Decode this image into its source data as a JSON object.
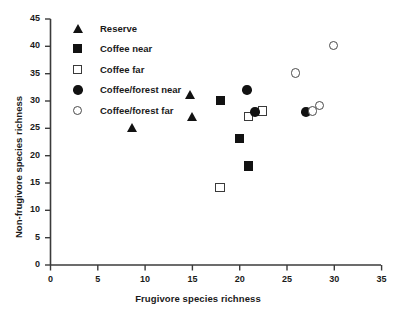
{
  "chart_data": {
    "type": "scatter",
    "title": "",
    "xlabel": "Frugivore species richness",
    "ylabel": "Non-frugivore species richness",
    "xlim": [
      0,
      35
    ],
    "ylim": [
      0,
      45
    ],
    "xticks": [
      0,
      5,
      10,
      15,
      20,
      25,
      30,
      35
    ],
    "yticks": [
      0,
      5,
      10,
      15,
      20,
      25,
      30,
      35,
      40,
      45
    ],
    "grid": false,
    "legend_position": "top-left-inside",
    "series": [
      {
        "name": "Reserve",
        "marker": "triangle-filled",
        "color": "#121212",
        "points": [
          {
            "x": 8.7,
            "y": 25
          },
          {
            "x": 14.8,
            "y": 31
          },
          {
            "x": 15.0,
            "y": 27
          }
        ]
      },
      {
        "name": "Coffee near",
        "marker": "square-filled",
        "color": "#121212",
        "points": [
          {
            "x": 18.0,
            "y": 30
          },
          {
            "x": 20.0,
            "y": 23
          },
          {
            "x": 21.0,
            "y": 18
          }
        ]
      },
      {
        "name": "Coffee far",
        "marker": "square-open",
        "color": "#3a3a3a",
        "points": [
          {
            "x": 18.0,
            "y": 14
          },
          {
            "x": 21.0,
            "y": 27
          },
          {
            "x": 22.5,
            "y": 28
          }
        ]
      },
      {
        "name": "Coffee/forest near",
        "marker": "circle-filled",
        "color": "#121212",
        "points": [
          {
            "x": 20.8,
            "y": 32
          },
          {
            "x": 21.6,
            "y": 28
          },
          {
            "x": 27.0,
            "y": 28
          }
        ]
      },
      {
        "name": "Coffee/forest far",
        "marker": "circle-open",
        "color": "#4a4a4a",
        "points": [
          {
            "x": 26.0,
            "y": 35
          },
          {
            "x": 27.8,
            "y": 28
          },
          {
            "x": 28.5,
            "y": 29
          },
          {
            "x": 30.0,
            "y": 40
          }
        ]
      }
    ]
  },
  "legend": {
    "items": [
      {
        "label": "Reserve",
        "marker": "triangle-filled"
      },
      {
        "label": "Coffee near",
        "marker": "square-filled"
      },
      {
        "label": "Coffee far",
        "marker": "square-open"
      },
      {
        "label": "Coffee/forest near",
        "marker": "circle-filled"
      },
      {
        "label": "Coffee/forest far",
        "marker": "circle-open"
      }
    ]
  }
}
